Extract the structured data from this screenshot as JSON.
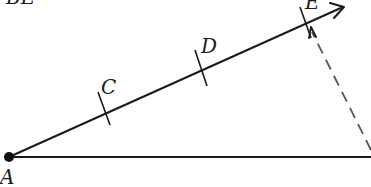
{
  "diagram": {
    "title_fragment": "BE",
    "colors": {
      "stroke": "#1a1a1a",
      "dashed": "#555555",
      "background": "#ffffff"
    },
    "points": [
      {
        "id": "A",
        "label": "A",
        "x": 9,
        "y": 157,
        "marked": true
      },
      {
        "id": "C",
        "label": "C",
        "x": 104,
        "y": 108
      },
      {
        "id": "D",
        "label": "D",
        "x": 202,
        "y": 67
      },
      {
        "id": "E",
        "label": "E",
        "x": 306,
        "y": 23
      }
    ],
    "ray": {
      "from": "A",
      "to_x": 345,
      "to_y": 6,
      "arrow": true
    },
    "base_line": {
      "from": "A",
      "to_x": 371,
      "to_y": 157
    },
    "dashed_line": {
      "from_x": 371,
      "from_y": 150,
      "to_x": 309,
      "to_y": 25,
      "arrow_at": "E"
    },
    "tick_marks": [
      "C",
      "D",
      "E"
    ]
  }
}
